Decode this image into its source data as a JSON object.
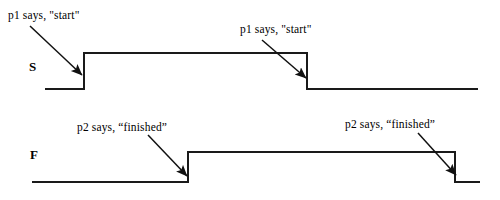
{
  "figure": {
    "type": "timing-diagram",
    "background_color": "#ffffff",
    "line_color": "#1a1a1a",
    "text_color": "#000000"
  },
  "signals": [
    {
      "key": "S",
      "name": "S",
      "name_x": 29,
      "name_y": 60,
      "low_y": 89,
      "high_y": 53,
      "x_start": 45,
      "x_end": 478,
      "transitions": [
        {
          "kind": "rise",
          "x": 84
        },
        {
          "kind": "fall",
          "x": 307
        }
      ]
    },
    {
      "key": "F",
      "name": "F",
      "name_x": 30,
      "name_y": 148,
      "low_y": 182,
      "high_y": 152,
      "x_start": 32,
      "x_end": 480,
      "transitions": [
        {
          "kind": "rise",
          "x": 188
        },
        {
          "kind": "fall",
          "x": 455
        }
      ]
    }
  ],
  "annotations": [
    {
      "id": "s-rise-label",
      "text": "p1 says, \"start\"",
      "text_x": 8,
      "text_y": 10,
      "arrow": {
        "x1": 30,
        "y1": 26,
        "x2": 82,
        "y2": 75
      }
    },
    {
      "id": "s-fall-label",
      "text": "p1 says, \"start\"",
      "text_x": 240,
      "text_y": 24,
      "arrow": {
        "x1": 262,
        "y1": 40,
        "x2": 306,
        "y2": 78
      }
    },
    {
      "id": "f-rise-label",
      "text": "p2 says, “finished”",
      "text_x": 77,
      "text_y": 122,
      "arrow": {
        "x1": 148,
        "y1": 135,
        "x2": 187,
        "y2": 176
      }
    },
    {
      "id": "f-fall-label",
      "text": "p2 says, “finished”",
      "text_x": 345,
      "text_y": 119,
      "arrow": {
        "x1": 418,
        "y1": 133,
        "x2": 456,
        "y2": 175
      }
    }
  ],
  "chart_data": {
    "type": "line",
    "title": "",
    "xlabel": "",
    "ylabel": "",
    "series": [
      {
        "name": "S",
        "levels": [
          "low",
          "high",
          "low"
        ],
        "edge_x": [
          84,
          307
        ],
        "points": [
          {
            "x": 45,
            "y": 0
          },
          {
            "x": 84,
            "y": 0
          },
          {
            "x": 84,
            "y": 1
          },
          {
            "x": 307,
            "y": 1
          },
          {
            "x": 307,
            "y": 0
          },
          {
            "x": 478,
            "y": 0
          }
        ]
      },
      {
        "name": "F",
        "levels": [
          "low",
          "high",
          "low"
        ],
        "edge_x": [
          188,
          455
        ],
        "points": [
          {
            "x": 32,
            "y": 0
          },
          {
            "x": 188,
            "y": 0
          },
          {
            "x": 188,
            "y": 1
          },
          {
            "x": 455,
            "y": 1
          },
          {
            "x": 455,
            "y": 0
          },
          {
            "x": 480,
            "y": 0
          }
        ]
      }
    ],
    "events": [
      {
        "signal": "S",
        "at_x": 84,
        "edge": "rise",
        "label": "p1 says, \"start\""
      },
      {
        "signal": "S",
        "at_x": 307,
        "edge": "fall",
        "label": "p1 says, \"start\""
      },
      {
        "signal": "F",
        "at_x": 188,
        "edge": "rise",
        "label": "p2 says, “finished”"
      },
      {
        "signal": "F",
        "at_x": 455,
        "edge": "fall",
        "label": "p2 says, “finished”"
      }
    ],
    "ylim": [
      0,
      1
    ],
    "grid": false,
    "legend": "none"
  }
}
